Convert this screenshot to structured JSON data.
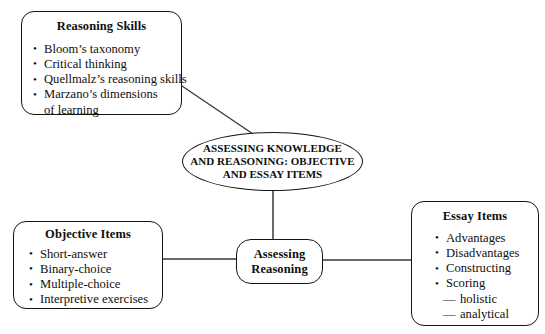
{
  "diagram": {
    "background_color": "#ffffff",
    "line_color": "#16150f",
    "text_color": "#100f0d"
  },
  "center_node": {
    "label": "ASSESSING KNOWLEDGE\nAND REASONING: OBJECTIVE\nAND ESSAY ITEMS",
    "shape": "ellipse"
  },
  "assessing_reasoning_node": {
    "label": "Assessing\nReasoning",
    "shape": "rounded-rect"
  },
  "reasoning_skills": {
    "title": "Reasoning Skills",
    "items": [
      {
        "text": "Bloom’s taxonomy",
        "bullet": true
      },
      {
        "text": "Critical thinking",
        "bullet": true
      },
      {
        "text": "Quellmalz’s reasoning skills",
        "bullet": true
      },
      {
        "text": "Marzano’s dimensions",
        "bullet": true
      },
      {
        "text": "of learning",
        "bullet": false
      }
    ]
  },
  "objective_items": {
    "title": "Objective Items",
    "items": [
      {
        "text": "Short-answer",
        "bullet": true
      },
      {
        "text": "Binary-choice",
        "bullet": true
      },
      {
        "text": "Multiple-choice",
        "bullet": true
      },
      {
        "text": "Interpretive exercises",
        "bullet": true
      }
    ]
  },
  "essay_items": {
    "title": "Essay Items",
    "items": [
      {
        "text": "Advantages",
        "bullet": true
      },
      {
        "text": "Disadvantages",
        "bullet": true
      },
      {
        "text": "Constructing",
        "bullet": true
      },
      {
        "text": "Scoring",
        "bullet": true
      }
    ],
    "sub_items": [
      {
        "text": "holistic"
      },
      {
        "text": "analytical"
      }
    ]
  },
  "connectors": [
    {
      "name": "reasoning-skills-to-center",
      "from": "reasoning-skills-box",
      "to": "center-ellipse"
    },
    {
      "name": "center-to-assessing-reasoning",
      "from": "center-ellipse",
      "to": "assessing-reasoning-box"
    },
    {
      "name": "objective-items-to-assessing-reasoning",
      "from": "objective-items-box",
      "to": "assessing-reasoning-box"
    },
    {
      "name": "assessing-reasoning-to-essay-items",
      "from": "assessing-reasoning-box",
      "to": "essay-items-box"
    }
  ]
}
